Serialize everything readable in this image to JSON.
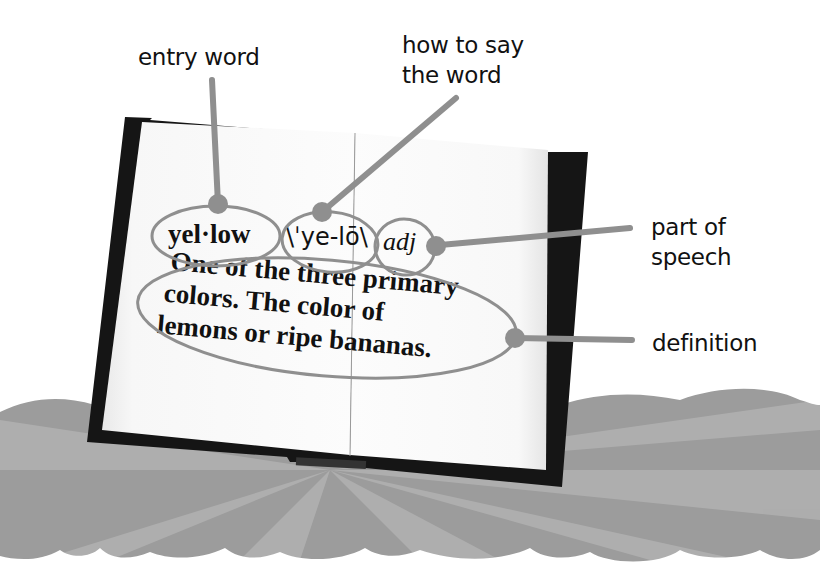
{
  "diagram": {
    "colors": {
      "callout": "#8f8f8f",
      "cover": "#151515",
      "page": "#fafafa",
      "ground": "#9a9a9a",
      "text": "#111111"
    },
    "entry": {
      "headword": "yel·low",
      "pronunciation": "\\ˈye-lō\\",
      "part_of_speech": "adj",
      "definition_lines": [
        "One of the three primary",
        "colors. The color of",
        "lemons or ripe bananas."
      ]
    },
    "callouts": [
      {
        "id": "entry-word",
        "lines": [
          "entry word"
        ]
      },
      {
        "id": "pronunciation",
        "lines": [
          "how to say",
          "the word"
        ]
      },
      {
        "id": "part-of-speech",
        "lines": [
          "part of",
          "speech"
        ]
      },
      {
        "id": "definition",
        "lines": [
          "definition"
        ]
      }
    ]
  }
}
